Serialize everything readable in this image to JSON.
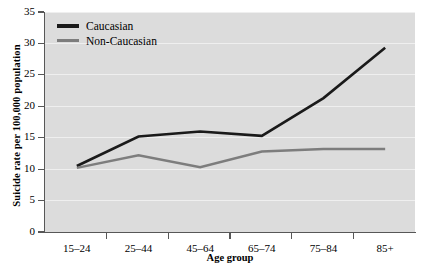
{
  "chart_data": {
    "type": "line",
    "title": "",
    "xlabel": "Age group",
    "ylabel": "Suicide rate per 100,000 population",
    "categories": [
      "15–24",
      "25–44",
      "45–64",
      "65–74",
      "75–84",
      "85+"
    ],
    "ylim": [
      0,
      35
    ],
    "yticks": [
      0,
      5,
      10,
      15,
      20,
      25,
      30,
      35
    ],
    "ytick_labels": [
      "0",
      "5",
      "10",
      "15",
      "20",
      "25",
      "30",
      "35"
    ],
    "grid": true,
    "legend_position": "top-left",
    "series": [
      {
        "name": "Caucasian",
        "color": "#1a1a1a",
        "values": [
          10.5,
          15.2,
          16.0,
          15.3,
          21.3,
          29.3
        ]
      },
      {
        "name": "Non-Caucasian",
        "color": "#7d7d7d",
        "values": [
          10.2,
          12.2,
          10.3,
          12.8,
          13.2,
          13.2
        ]
      }
    ]
  },
  "legend": {
    "items": [
      {
        "label": "Caucasian"
      },
      {
        "label": "Non-Caucasian"
      }
    ]
  },
  "axes": {
    "y_title": "Suicide rate per 100,000 population",
    "x_title": "Age group"
  }
}
